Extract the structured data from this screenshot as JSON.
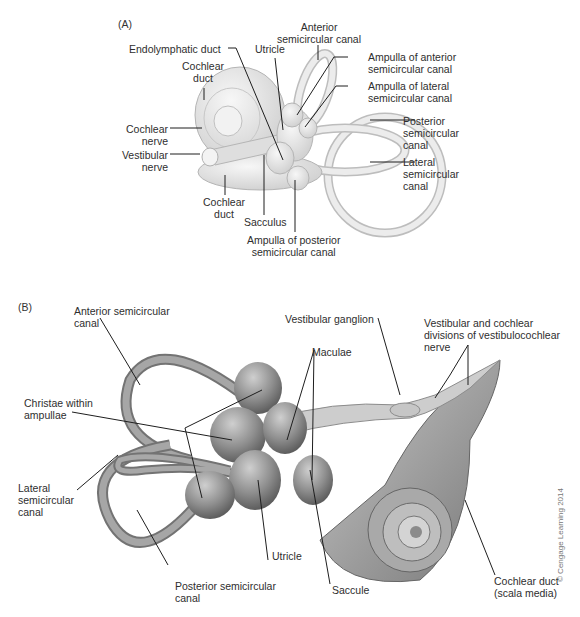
{
  "figure": {
    "panel_a": {
      "tag": "(A)",
      "labels": {
        "anterior_canal": "Anterior\nsemicircular canal",
        "endolymphatic_duct": "Endolymphatic duct",
        "utricle": "Utricle",
        "cochlear_duct_top": "Cochlear\nduct",
        "ampulla_anterior": "Ampulla of anterior\nsemicircular canal",
        "ampulla_lateral": "Ampulla of lateral\nsemicircular canal",
        "posterior_canal": "Posterior\nsemicircular\ncanal",
        "lateral_canal": "Lateral\nsemicircular\ncanal",
        "cochlear_nerve": "Cochlear\nnerve",
        "vestibular_nerve": "Vestibular\nnerve",
        "cochlear_duct_bottom": "Cochlear\nduct",
        "sacculus": "Sacculus",
        "ampulla_posterior": "Ampulla of posterior\nsemicircular canal"
      }
    },
    "panel_b": {
      "tag": "(B)",
      "labels": {
        "anterior_canal": "Anterior semicircular\ncanal",
        "vestibular_ganglion": "Vestibular ganglion",
        "vc_divisions": "Vestibular and cochlear\ndivisions of vestibulocochlear\nnerve",
        "maculae": "Maculae",
        "christae": "Christae within\nampullae",
        "lateral_canal": "Lateral\nsemicircular\ncanal",
        "utricle": "Utricle",
        "posterior_canal": "Posterior semicircular\ncanal",
        "saccule": "Saccule",
        "cochlear_duct": "Cochlear duct\n(scala media)"
      }
    },
    "copyright": "© Cengage Learning 2014",
    "colors": {
      "panel_a_tissue": "#e6e6e6",
      "panel_a_outline": "#b5b5b5",
      "panel_b_tissue": "#9a9a9a",
      "panel_b_dark": "#6e6e6e",
      "leader_line": "#1e1e1e"
    }
  }
}
